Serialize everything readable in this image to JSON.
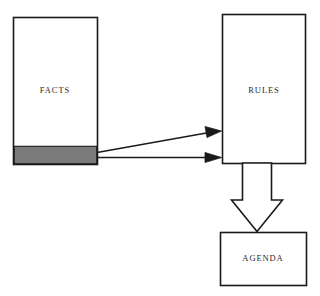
{
  "diagram": {
    "background_color": "#ffffff",
    "stroke_color": "#1a1a1a",
    "fill_color": "#ffffff",
    "highlight_color": "#7a7a7a",
    "nodes": [
      {
        "id": "facts",
        "label": "FACTS",
        "shape": "rectangle",
        "x": 13,
        "y": 17,
        "width": 84,
        "height": 147,
        "label_x": 55,
        "label_y": 91,
        "highlight_band": {
          "name": "matched-facts-band",
          "x": 13,
          "y": 146,
          "width": 84,
          "height": 18,
          "color": "#7a7a7a"
        }
      },
      {
        "id": "rules",
        "label": "RULES",
        "shape": "rectangle",
        "x": 222,
        "y": 14,
        "width": 83,
        "height": 149,
        "label_x": 263,
        "label_y": 91
      },
      {
        "id": "agenda",
        "label": "AGENDA",
        "shape": "rectangle",
        "x": 220,
        "y": 232,
        "width": 86,
        "height": 53,
        "label_x": 263,
        "label_y": 258
      }
    ],
    "connectors": [
      {
        "id": "facts-to-rules-upper",
        "style": "thin-line-solid-arrowhead",
        "from": "facts",
        "to": "rules",
        "x1": 97,
        "y1": 152,
        "x2": 221,
        "y2": 131
      },
      {
        "id": "facts-to-rules-lower",
        "style": "thin-line-solid-arrowhead",
        "from": "facts",
        "to": "rules",
        "x1": 97,
        "y1": 157,
        "x2": 221,
        "y2": 157
      },
      {
        "id": "rules-to-agenda",
        "style": "hollow-block-arrow",
        "from": "rules",
        "to": "agenda",
        "shaft_left": 242,
        "shaft_right": 272,
        "top": 163,
        "wing_y": 200,
        "wing_left": 231,
        "wing_right": 283,
        "tip_x": 257,
        "tip_y": 232
      }
    ]
  }
}
